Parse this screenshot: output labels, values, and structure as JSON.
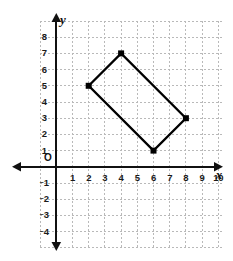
{
  "figure": {
    "kind": "coordinate-plane",
    "background_color": "#ffffff",
    "origin_label": "O",
    "x_axis_name": "x",
    "y_axis_name": "y"
  },
  "chart_data": {
    "type": "scatter",
    "title": "",
    "xlabel": "x",
    "ylabel": "y",
    "xlim": [
      -1,
      11
    ],
    "ylim": [
      -5,
      9
    ],
    "grid": true,
    "grid_style": "dotted",
    "grid_color": "#b9b9b9",
    "legend": "none",
    "x_ticks": [
      1,
      2,
      3,
      4,
      5,
      6,
      7,
      8,
      9,
      10
    ],
    "x_tick_labels": [
      "1",
      "2",
      "3",
      "4",
      "5",
      "6",
      "7",
      "8",
      "9",
      "10"
    ],
    "y_ticks": [
      8,
      7,
      6,
      5,
      4,
      3,
      2,
      1,
      -1,
      -2,
      -3,
      -4
    ],
    "y_tick_labels": [
      "8",
      "7",
      "6",
      "5",
      "4",
      "3",
      "2",
      "1",
      "⁻1",
      "⁻2",
      "⁻3",
      "⁻4"
    ],
    "series": [
      {
        "name": "rectangle",
        "shape": "polygon",
        "closed": true,
        "color": "#000000",
        "marker": "filled-square",
        "points": [
          {
            "label": "A",
            "x": 2,
            "y": 5
          },
          {
            "label": "B",
            "x": 4,
            "y": 7
          },
          {
            "label": "C",
            "x": 8,
            "y": 3
          },
          {
            "label": "D",
            "x": 6,
            "y": 1
          }
        ]
      }
    ]
  }
}
